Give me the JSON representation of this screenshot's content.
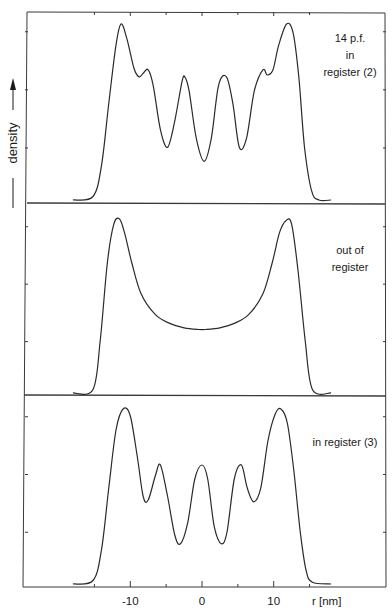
{
  "chart_data": {
    "type": "line",
    "title": "",
    "xlabel": "r [nm]",
    "ylabel": "density",
    "xlim": [
      -18,
      18
    ],
    "x_ticks": [
      -10,
      0,
      10
    ],
    "x_tick_labels": [
      "-10",
      "0",
      "10"
    ],
    "x_minor_ticks": [
      -15,
      -5,
      5,
      15
    ],
    "grid": false,
    "legend": "none (panel annotations at upper right)",
    "panels": [
      {
        "name": "14 p.f. in register (2)",
        "annotation": [
          "14 p.f.",
          "in",
          "register (2)"
        ],
        "x": [
          -18,
          -15.2,
          -14,
          -13,
          -12,
          -11.3,
          -10.5,
          -9.5,
          -8.8,
          -8.2,
          -7.5,
          -6.8,
          -5.8,
          -4.8,
          -3.8,
          -2.8,
          -2.4,
          -1.8,
          -0.8,
          0.3,
          1.3,
          2.3,
          3.4,
          4.3,
          5.2,
          6.2,
          7.3,
          8.5,
          9.1,
          9.9,
          10.7,
          11.8,
          12.7,
          13.5,
          14.3,
          15.3,
          16.3,
          18
        ],
        "y": [
          0,
          0.02,
          0.2,
          0.55,
          0.88,
          1.0,
          0.92,
          0.75,
          0.7,
          0.72,
          0.74,
          0.65,
          0.4,
          0.3,
          0.45,
          0.67,
          0.7,
          0.62,
          0.35,
          0.22,
          0.35,
          0.65,
          0.7,
          0.55,
          0.3,
          0.35,
          0.62,
          0.74,
          0.71,
          0.74,
          0.88,
          1.0,
          0.95,
          0.7,
          0.3,
          0.05,
          0,
          0
        ]
      },
      {
        "name": "out of register",
        "annotation": [
          "out of",
          "register"
        ],
        "x": [
          -18,
          -15.2,
          -14.2,
          -13.2,
          -12.3,
          -11.5,
          -10.8,
          -9.8,
          -8.5,
          -6.5,
          -4.5,
          -2.5,
          -0.5,
          0.5,
          2.5,
          4.5,
          6.5,
          8.5,
          9.8,
          10.8,
          11.7,
          12.5,
          13.4,
          14.4,
          15.4,
          18
        ],
        "y": [
          0,
          0.02,
          0.3,
          0.75,
          0.97,
          1.0,
          0.92,
          0.75,
          0.57,
          0.45,
          0.4,
          0.375,
          0.365,
          0.365,
          0.375,
          0.4,
          0.45,
          0.57,
          0.75,
          0.92,
          0.99,
          0.97,
          0.7,
          0.3,
          0.02,
          0
        ]
      },
      {
        "name": "in register (3)",
        "annotation": [
          "in register (3)"
        ],
        "x": [
          -18,
          -15.2,
          -14,
          -13,
          -12,
          -11,
          -10,
          -9,
          -8.2,
          -7.5,
          -6.5,
          -5.8,
          -4.8,
          -3.8,
          -3,
          -2,
          -1,
          0,
          0.8,
          1.7,
          2.7,
          3.5,
          4.5,
          5.5,
          6.3,
          7.2,
          8.2,
          9.2,
          10.2,
          11,
          11.9,
          12.8,
          13.7,
          14.5,
          15.4,
          18
        ],
        "y": [
          0,
          0.02,
          0.2,
          0.55,
          0.88,
          1.0,
          0.96,
          0.72,
          0.5,
          0.48,
          0.62,
          0.68,
          0.5,
          0.28,
          0.23,
          0.35,
          0.6,
          0.68,
          0.6,
          0.33,
          0.23,
          0.3,
          0.6,
          0.68,
          0.55,
          0.47,
          0.55,
          0.82,
          0.97,
          1.0,
          0.92,
          0.65,
          0.3,
          0.08,
          0.01,
          0
        ]
      }
    ]
  },
  "figure": {
    "ylabel_text": "density",
    "xlabel_text": "r [nm]"
  }
}
